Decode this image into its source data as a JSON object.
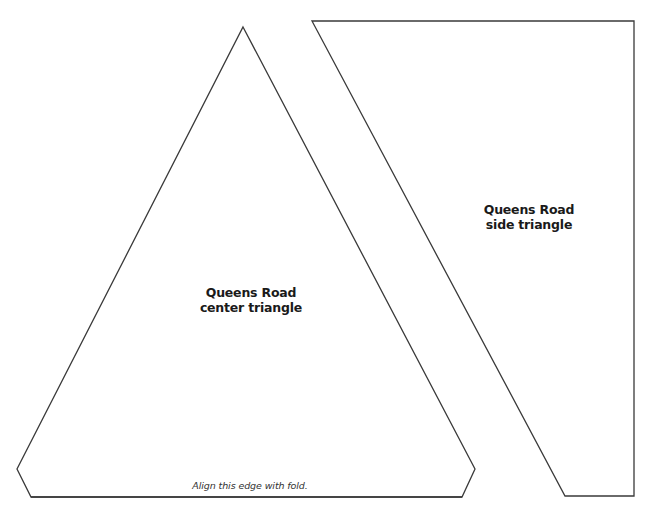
{
  "pieces": {
    "center_triangle": {
      "title_line1": "Queens Road",
      "title_line2": "center triangle",
      "fold_note": "Align this edge with fold."
    },
    "side_triangle": {
      "title_line1": "Queens Road",
      "title_line2": "side triangle"
    }
  },
  "colors": {
    "outline": "#3a3a3a",
    "background": "#ffffff",
    "text": "#1a1a1a"
  }
}
